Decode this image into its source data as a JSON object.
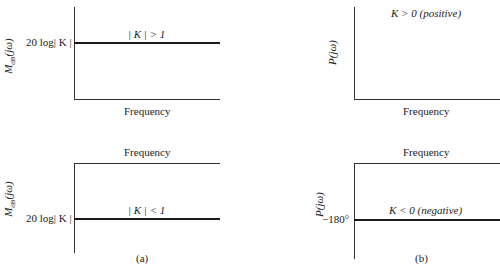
{
  "figure": {
    "panels": [
      {
        "id": "a-top",
        "ylabel": "M_dB(jω)",
        "ylabel_main": "M",
        "ylabel_sub": "dB",
        "ylabel_arg": "(jω)",
        "tick_label": "20 log| K |",
        "annotation": "| K | > 1",
        "xlabel": "Frequency"
      },
      {
        "id": "b-top",
        "ylabel": "P(jω)",
        "annotation": "K > 0 (positive)",
        "xlabel": "Frequency"
      },
      {
        "id": "a-bottom",
        "ylabel": "M_dB(jω)",
        "ylabel_main": "M",
        "ylabel_sub": "dB",
        "ylabel_arg": "(jω)",
        "tick_label": "20 log| K |",
        "annotation": "| K | < 1",
        "xlabel": "Frequency",
        "caption": "(a)"
      },
      {
        "id": "b-bottom",
        "ylabel": "P(jω)",
        "tick_label": "−180°",
        "annotation": "K < 0 (negative)",
        "xlabel": "Frequency",
        "caption": "(b)"
      }
    ]
  }
}
